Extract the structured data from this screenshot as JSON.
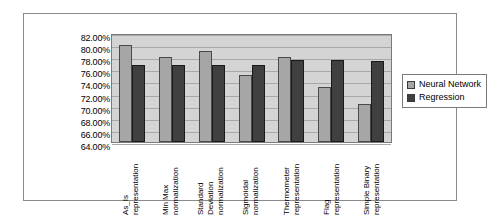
{
  "chart_data": {
    "type": "bar",
    "title": "",
    "xlabel": "",
    "ylabel": "",
    "ylim": [
      64,
      82
    ],
    "ytick_step": 2,
    "grid": true,
    "legend_position": "right",
    "categories": [
      "As_Is representation",
      "Min Max normalization",
      "Standard Deviation normalization",
      "Sigmoidal normalization",
      "Thermometer representation",
      "Flag representation",
      "Simple Binary representation"
    ],
    "category_lines": [
      [
        "As_Is",
        "representation"
      ],
      [
        "Min Max",
        "normalization"
      ],
      [
        "Standard",
        "Deviation",
        "normalization"
      ],
      [
        "Sigmoidal",
        "normalization"
      ],
      [
        "Thermometer",
        "representation"
      ],
      [
        "Flag",
        "representation"
      ],
      [
        "Simple Binary",
        "representation"
      ]
    ],
    "ytick_labels": [
      "82.00%",
      "80.00%",
      "78.00%",
      "76.00%",
      "74.00%",
      "72.00%",
      "70.00%",
      "68.00%",
      "66.00%",
      "64.00%"
    ],
    "ytick_values": [
      82,
      80,
      78,
      76,
      74,
      72,
      70,
      68,
      66,
      64
    ],
    "series": [
      {
        "name": "Neural Network",
        "color": "#a6a6a6",
        "values": [
          80.1,
          78.0,
          79.1,
          75.1,
          78.1,
          73.1,
          70.2
        ]
      },
      {
        "name": "Regression",
        "color": "#404040",
        "values": [
          76.8,
          76.8,
          76.8,
          76.7,
          77.5,
          77.5,
          77.3
        ]
      }
    ]
  },
  "legend": {
    "items": [
      {
        "label": "Neural Network"
      },
      {
        "label": "Regression"
      }
    ]
  }
}
